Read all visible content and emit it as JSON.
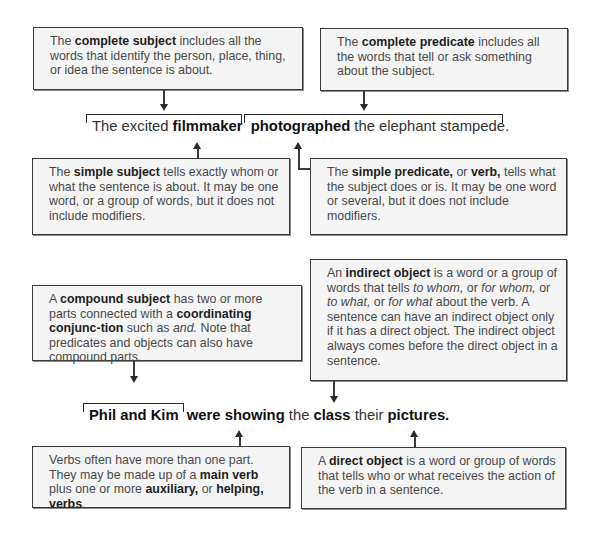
{
  "diagram": {
    "sentence1": {
      "parts": [
        {
          "text": "The excited ",
          "bold": false
        },
        {
          "text": "filmmaker",
          "bold": true
        },
        {
          "text": "photographed",
          "bold": true
        },
        {
          "text": " the elephant stampede.",
          "bold": false
        }
      ]
    },
    "sentence2": {
      "parts": [
        {
          "text": "Phil and Kim",
          "bold": true
        },
        {
          "text": "were showing",
          "bold": true
        },
        {
          "text": " the ",
          "bold": false
        },
        {
          "text": "class",
          "bold": true
        },
        {
          "text": " their ",
          "bold": false
        },
        {
          "text": "pictures.",
          "bold": true
        }
      ]
    },
    "boxes": {
      "complete_subject": {
        "t1": "The ",
        "b1": "complete subject",
        "t2": " includes all the words that identify the person, place, thing, or idea the sentence is about."
      },
      "complete_predicate": {
        "t1": "The ",
        "b1": "complete predicate",
        "t2": " includes all the words that tell or ask something about the subject."
      },
      "simple_subject": {
        "t1": "The ",
        "b1": "simple subject",
        "t2": " tells exactly whom or what the sentence is about. It may be one word, or a group of words, but it does not include modifiers."
      },
      "simple_predicate": {
        "t1": "The ",
        "b1": "simple predicate,",
        "t2": " or ",
        "b2": "verb,",
        "t3": " tells what the subject does or is. It may be one word or several, but it does not include modifiers."
      },
      "indirect_object": {
        "t1": "An ",
        "b1": "indirect object",
        "t2": " is a word or a group of words that tells ",
        "i1": "to whom,",
        "t3": " or ",
        "i2": "for whom,",
        "t4": " or ",
        "i3": "to what,",
        "t5": " or ",
        "i4": "for what",
        "t6": " about the verb. A sentence can have an indirect object only if it has a direct object. The indirect object always comes before the direct object in a sentence."
      },
      "compound_subject": {
        "t1": "A ",
        "b1": "compound subject",
        "t2": " has two or more parts connected with a ",
        "b2": "coordinating conjunc-tion",
        "t3": " such as ",
        "i1": "and.",
        "t4": " Note that predicates and objects can also have compound parts."
      },
      "verbs": {
        "t1": "Verbs often have more than one part. They may be made up of a ",
        "b1": "main verb",
        "t2": " plus one or more ",
        "b2": "auxiliary,",
        "t3": " or ",
        "b3": "helping, verbs",
        "t4": "."
      },
      "direct_object": {
        "t1": "A ",
        "b1": "direct object",
        "t2": " is a word or group of words that tells who or what receives the action of the verb in a sentence."
      }
    }
  }
}
